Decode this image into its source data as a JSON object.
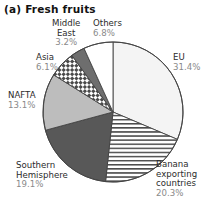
{
  "chart_data": {
    "type": "pie",
    "title": "(a) Fresh fruits",
    "xlabel": "",
    "ylabel": "",
    "legend_position": "none",
    "grid": false,
    "units": "percent",
    "total": 100.0,
    "categories": [
      "EU",
      "Banana exporting countries",
      "Southern Hemisphere",
      "NAFTA",
      "Asia",
      "Middle East",
      "Others"
    ],
    "values": [
      31.4,
      20.3,
      19.1,
      13.1,
      6.1,
      3.2,
      6.8
    ],
    "slices": [
      {
        "name": "EU",
        "label_lines": [
          "EU"
        ],
        "value": 31.4,
        "value_text": "31.4%",
        "fill": "#f4f4f4",
        "pattern": "solid",
        "start_angle": 0.0,
        "end_angle": 113.04,
        "label_anchor": "left"
      },
      {
        "name": "Banana exporting countries",
        "label_lines": [
          "Banana",
          "exporting",
          "countries"
        ],
        "value": 20.3,
        "value_text": "20.3%",
        "fill": "#ffffff",
        "pattern": "horizontal-lines",
        "start_angle": 113.04,
        "end_angle": 186.12,
        "label_anchor": "left"
      },
      {
        "name": "Southern Hemisphere",
        "label_lines": [
          "Southern",
          "Hemisphere"
        ],
        "value": 19.1,
        "value_text": "19.1%",
        "fill": "#585858",
        "pattern": "solid",
        "start_angle": 186.12,
        "end_angle": 254.88,
        "label_anchor": "right"
      },
      {
        "name": "NAFTA",
        "label_lines": [
          "NAFTA"
        ],
        "value": 13.1,
        "value_text": "13.1%",
        "fill": "#bdbdbd",
        "pattern": "solid",
        "start_angle": 254.88,
        "end_angle": 302.04,
        "label_anchor": "right"
      },
      {
        "name": "Asia",
        "label_lines": [
          "Asia"
        ],
        "value": 6.1,
        "value_text": "6.1%",
        "fill": "#ffffff",
        "pattern": "checkerboard",
        "start_angle": 302.04,
        "end_angle": 324.0,
        "label_anchor": "right"
      },
      {
        "name": "Middle East",
        "label_lines": [
          "Middle",
          "East"
        ],
        "value": 3.2,
        "value_text": "3.2%",
        "fill": "#6e6e6e",
        "pattern": "solid",
        "start_angle": 324.0,
        "end_angle": 335.52,
        "label_anchor": "center"
      },
      {
        "name": "Others",
        "label_lines": [
          "Others"
        ],
        "value": 6.8,
        "value_text": "6.8%",
        "fill": "#ffffff",
        "pattern": "solid",
        "start_angle": 335.52,
        "end_angle": 360.0,
        "label_anchor": "center"
      }
    ],
    "geometry": {
      "center_x": 113,
      "center_y": 112,
      "radius": 70,
      "start_at_12_oclock": true,
      "direction": "clockwise"
    },
    "colors": {
      "outline": "#444444",
      "label_text": "#2b2b2b",
      "value_text": "#8a8a8a",
      "title_text": "#111111",
      "background": "#ffffff"
    }
  },
  "labels": {
    "eu": {
      "name": "EU",
      "value": "31.4%"
    },
    "banana": {
      "line1": "Banana",
      "line2": "exporting",
      "line3": "countries",
      "value": "20.3%"
    },
    "southern": {
      "line1": "Southern",
      "line2": "Hemisphere",
      "value": "19.1%"
    },
    "nafta": {
      "name": "NAFTA",
      "value": "13.1%"
    },
    "asia": {
      "name": "Asia",
      "value": "6.1%"
    },
    "middle_east": {
      "line1": "Middle",
      "line2": "East",
      "value": "3.2%"
    },
    "others": {
      "name": "Others",
      "value": "6.8%"
    }
  }
}
